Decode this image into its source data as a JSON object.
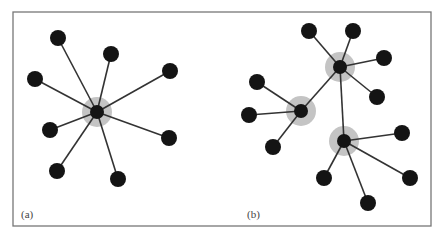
{
  "figure": {
    "frame": {
      "x": 13,
      "y": 12,
      "width": 418,
      "height": 214,
      "stroke": "#777777"
    },
    "colors": {
      "node": "#141414",
      "edge": "#333333",
      "halo": "#c4c4c4",
      "label": "#444444"
    },
    "node_radius": 8,
    "hub_radius": 7,
    "halo_radius": 15,
    "panels": [
      {
        "id": "a",
        "label": "(a)",
        "label_pos": [
          21,
          218
        ],
        "description": "Star network: single hub with 8 leaves",
        "hubs": [
          {
            "x": 97,
            "y": 112
          }
        ],
        "leaves": [
          {
            "x": 58,
            "y": 38,
            "hub": 0
          },
          {
            "x": 111,
            "y": 54,
            "hub": 0
          },
          {
            "x": 170,
            "y": 71,
            "hub": 0
          },
          {
            "x": 35,
            "y": 79,
            "hub": 0
          },
          {
            "x": 50,
            "y": 130,
            "hub": 0
          },
          {
            "x": 169,
            "y": 138,
            "hub": 0
          },
          {
            "x": 57,
            "y": 171,
            "hub": 0
          },
          {
            "x": 118,
            "y": 179,
            "hub": 0
          }
        ],
        "hub_links": []
      },
      {
        "id": "b",
        "label": "(b)",
        "label_pos": [
          247,
          218
        ],
        "description": "Multi-hub network: three connected hubs with leaves",
        "hubs": [
          {
            "x": 340,
            "y": 67
          },
          {
            "x": 301,
            "y": 111
          },
          {
            "x": 344,
            "y": 141
          }
        ],
        "leaves": [
          {
            "x": 309,
            "y": 31,
            "hub": 0
          },
          {
            "x": 353,
            "y": 31,
            "hub": 0
          },
          {
            "x": 384,
            "y": 58,
            "hub": 0
          },
          {
            "x": 377,
            "y": 97,
            "hub": 0
          },
          {
            "x": 257,
            "y": 82,
            "hub": 1
          },
          {
            "x": 249,
            "y": 115,
            "hub": 1
          },
          {
            "x": 273,
            "y": 147,
            "hub": 1
          },
          {
            "x": 402,
            "y": 133,
            "hub": 2
          },
          {
            "x": 410,
            "y": 178,
            "hub": 2
          },
          {
            "x": 368,
            "y": 203,
            "hub": 2
          },
          {
            "x": 324,
            "y": 178,
            "hub": 2
          }
        ],
        "hub_links": [
          [
            0,
            1
          ],
          [
            0,
            2
          ]
        ]
      }
    ]
  }
}
